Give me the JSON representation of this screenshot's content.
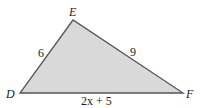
{
  "diagram": {
    "type": "triangle",
    "fill_color": "#d9d9d9",
    "stroke_color": "#555555",
    "vertices": [
      {
        "name": "E",
        "x": 73,
        "y": 20
      },
      {
        "name": "D",
        "x": 20,
        "y": 93
      },
      {
        "name": "F",
        "x": 183,
        "y": 93
      }
    ],
    "vertex_labels": {
      "E": "E",
      "D": "D",
      "F": "F"
    },
    "side_labels": {
      "DE": "6",
      "EF": "9",
      "DF": "2x + 5"
    }
  }
}
